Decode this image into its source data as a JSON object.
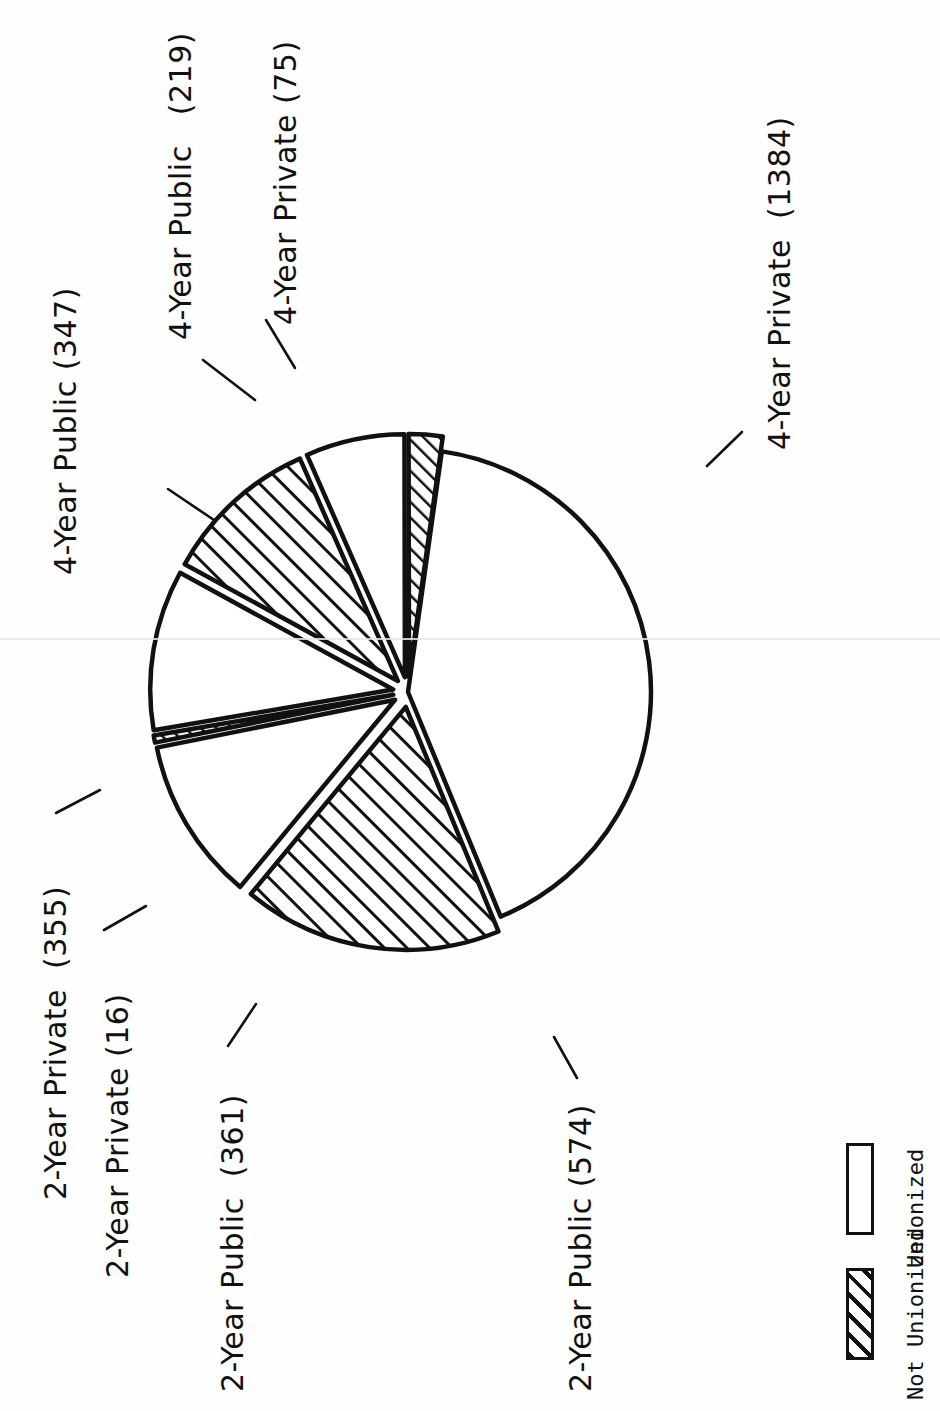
{
  "chart_data": {
    "type": "pie",
    "title": "",
    "total": 3331,
    "categories": [
      "4-Year Private (1384)",
      "2-Year Public (574)",
      "2-Year Public (361)",
      "2-Year Private (16)",
      "2-Year Private (355)",
      "4-Year Public (347)",
      "4-Year Public (219)",
      "4-Year Private (75)"
    ],
    "values": [
      1384,
      574,
      361,
      16,
      355,
      347,
      219,
      75
    ],
    "slices": [
      {
        "label": "4-Year Private (1384)",
        "value": 1384,
        "fill": "none",
        "group": "Not Unionized",
        "exploded": false
      },
      {
        "label": "2-Year Public (574)",
        "value": 574,
        "fill": "hatch",
        "group": "Unionized",
        "exploded": true
      },
      {
        "label": "2-Year Public (361)",
        "value": 361,
        "fill": "none",
        "group": "Not Unionized",
        "exploded": true
      },
      {
        "label": "2-Year Private (16)",
        "value": 16,
        "fill": "hatch",
        "group": "Unionized",
        "exploded": true
      },
      {
        "label": "2-Year Private (355)",
        "value": 355,
        "fill": "none",
        "group": "Not Unionized",
        "exploded": true
      },
      {
        "label": "4-Year Public (347)",
        "value": 347,
        "fill": "hatch",
        "group": "Unionized",
        "exploded": true
      },
      {
        "label": "4-Year Public (219)",
        "value": 219,
        "fill": "none",
        "group": "Not Unionized",
        "exploded": true
      },
      {
        "label": "4-Year Private (75)",
        "value": 75,
        "fill": "hatch",
        "group": "Unionized",
        "exploded": true
      }
    ],
    "legend": {
      "position": "bottom-right",
      "entries": [
        {
          "label": "Unionized",
          "swatch": "hatched"
        },
        {
          "label": "Not Unionized",
          "swatch": "empty"
        }
      ]
    },
    "colors": {
      "stroke": "#111111",
      "background": "#ffffff",
      "hatch": "#111111"
    },
    "grid": false,
    "xlabel": "",
    "ylabel": ""
  },
  "labels": {
    "four_year_private_1384": "4-Year Private  (1384)",
    "four_year_public_347": "4-Year Public (347)",
    "four_year_public_219": "4-Year Public   (219)",
    "four_year_private_75": "4-Year Private (75)",
    "two_year_private_355": "2-Year Private  (355)",
    "two_year_private_16": "2-Year Private (16)",
    "two_year_public_361": "2-Year Public  (361)",
    "two_year_public_574": "2-Year Public (574)"
  },
  "legend": {
    "unionized": "Unionized",
    "not_unionized": "Not Unionized"
  }
}
